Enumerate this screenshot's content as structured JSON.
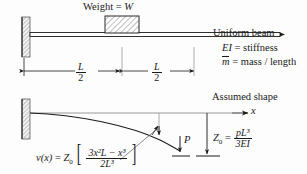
{
  "figure": {
    "colors": {
      "ink": "#1a1a1a",
      "hatch": "#777777",
      "wall": "#8a8a8a",
      "background": "#fdfdfd"
    }
  },
  "top_panel": {
    "weight_label_prefix": "Weight =",
    "weight_symbol": "W",
    "beam_label": "Uniform beam",
    "stiffness_symbol": "EI",
    "stiffness_eq": "= stiffness",
    "mass_symbol": "m",
    "mass_eq": "= mass / length",
    "dim_left_num": "L",
    "dim_left_den": "2",
    "dim_right_num": "L",
    "dim_right_den": "2"
  },
  "bottom_panel": {
    "assumed_shape_label": "Assumed shape",
    "axis_label": "x",
    "load_label": "P",
    "deflection_symbol": "Z",
    "deflection_sub": "0",
    "equation": {
      "lhs_fn": "v",
      "lhs_arg": "(x)",
      "equals": "=",
      "amp_symbol": "Z",
      "amp_sub": "0",
      "bracket_open": "[",
      "bracket_close": "]",
      "numerator": "3x²L − x³",
      "denominator": "2L³"
    },
    "z0_formula": {
      "symbol": "Z",
      "sub": "0",
      "equals": "=",
      "numerator": "pL³",
      "denominator": "3EI"
    }
  }
}
